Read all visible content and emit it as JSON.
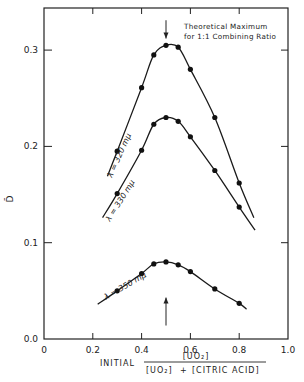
{
  "chart_data": {
    "type": "line",
    "title": "",
    "xlabel": "INITIAL [UO2] / ([UO2] + [CITRIC ACID])",
    "xlabel_parts": {
      "prefix": "INITIAL",
      "numerator": "[UO₂]",
      "denominator_a": "[UO₂]",
      "plus": "+",
      "denominator_b": "[CITRIC ACID]"
    },
    "ylabel": "D̄",
    "xlim": [
      0,
      1.0
    ],
    "ylim": [
      0.0,
      0.344
    ],
    "x_ticks": [
      0,
      0.2,
      0.4,
      0.6,
      0.8,
      1.0
    ],
    "x_tick_labels": [
      "0",
      "0.2",
      "0.4",
      "0.6",
      "0.8",
      "1.0"
    ],
    "y_ticks": [
      0.0,
      0.1,
      0.2,
      0.3
    ],
    "y_tick_labels": [
      "0.0",
      "0.1",
      "0.2",
      "0.3"
    ],
    "grid": false,
    "legend": null,
    "series": [
      {
        "name": "λ = 320 mμ",
        "points": [
          [
            0.3,
            0.195
          ],
          [
            0.4,
            0.261
          ],
          [
            0.45,
            0.295
          ],
          [
            0.5,
            0.305
          ],
          [
            0.55,
            0.303
          ],
          [
            0.6,
            0.28
          ],
          [
            0.7,
            0.23
          ],
          [
            0.8,
            0.162
          ]
        ],
        "line": [
          [
            0.26,
            0.169
          ],
          [
            0.3,
            0.195
          ],
          [
            0.4,
            0.261
          ],
          [
            0.45,
            0.295
          ],
          [
            0.5,
            0.305
          ],
          [
            0.55,
            0.303
          ],
          [
            0.6,
            0.28
          ],
          [
            0.7,
            0.23
          ],
          [
            0.8,
            0.162
          ],
          [
            0.86,
            0.126
          ]
        ]
      },
      {
        "name": "λ = 330 mμ",
        "points": [
          [
            0.3,
            0.151
          ],
          [
            0.4,
            0.196
          ],
          [
            0.45,
            0.223
          ],
          [
            0.5,
            0.23
          ],
          [
            0.55,
            0.226
          ],
          [
            0.6,
            0.21
          ],
          [
            0.7,
            0.175
          ],
          [
            0.8,
            0.137
          ]
        ],
        "line": [
          [
            0.24,
            0.126
          ],
          [
            0.3,
            0.151
          ],
          [
            0.4,
            0.196
          ],
          [
            0.45,
            0.223
          ],
          [
            0.5,
            0.23
          ],
          [
            0.55,
            0.226
          ],
          [
            0.6,
            0.21
          ],
          [
            0.7,
            0.175
          ],
          [
            0.8,
            0.137
          ],
          [
            0.865,
            0.113
          ]
        ]
      },
      {
        "name": "λ = 350 mμ",
        "points": [
          [
            0.3,
            0.05
          ],
          [
            0.4,
            0.068
          ],
          [
            0.45,
            0.078
          ],
          [
            0.5,
            0.08
          ],
          [
            0.55,
            0.077
          ],
          [
            0.6,
            0.07
          ],
          [
            0.7,
            0.052
          ],
          [
            0.8,
            0.037
          ]
        ],
        "line": [
          [
            0.22,
            0.036
          ],
          [
            0.3,
            0.05
          ],
          [
            0.4,
            0.068
          ],
          [
            0.45,
            0.078
          ],
          [
            0.5,
            0.08
          ],
          [
            0.55,
            0.077
          ],
          [
            0.6,
            0.07
          ],
          [
            0.7,
            0.052
          ],
          [
            0.8,
            0.037
          ],
          [
            0.83,
            0.031
          ]
        ]
      }
    ],
    "annotations": [
      {
        "text": "Theoretical Maximum",
        "line": 1
      },
      {
        "text": "for 1:1 Combining Ratio",
        "line": 2
      }
    ],
    "arrows": [
      {
        "x": 0.5,
        "direction": "down",
        "from_y": 0.331,
        "to_y": 0.312
      },
      {
        "x": 0.5,
        "direction": "up",
        "from_y": 0.014,
        "to_y": 0.043
      }
    ]
  },
  "curve_labels": [
    "λ = 320 mμ",
    "λ = 330 mμ",
    "λ = 350 mμ"
  ],
  "annotation": {
    "line1": "Theoretical Maximum",
    "line2": "for 1:1 Combining Ratio"
  }
}
